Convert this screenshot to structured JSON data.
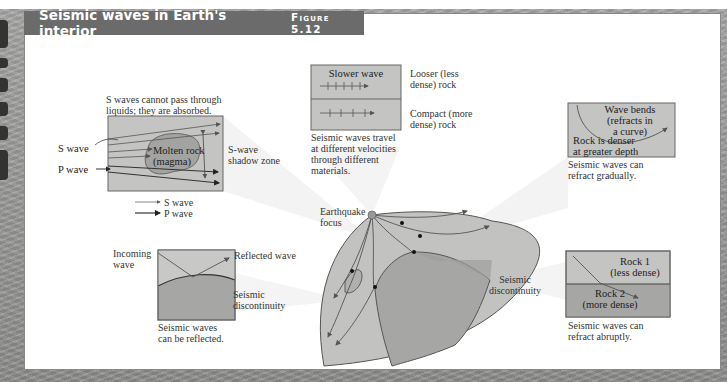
{
  "figure": {
    "title": "Seismic waves in Earth's interior",
    "label": "Figure 5.12"
  },
  "colors": {
    "title_bar": "#6b6b6b",
    "box_light": "#c9c9c7",
    "box_dark": "#a9a9a7",
    "line": "#555555",
    "background_stone": "#9a9a98"
  },
  "absorption_panel": {
    "caption": [
      "S waves cannot pass through",
      "liquids; they are absorbed."
    ],
    "s_wave_label": "S wave",
    "p_wave_label": "P wave",
    "magma_label": [
      "Molten rock",
      "(magma)"
    ],
    "shadow_zone_label": [
      "S-wave",
      "shadow zone"
    ],
    "legend": [
      {
        "icon": "thin-arrow-icon",
        "label": "S wave"
      },
      {
        "icon": "thick-arrow-icon",
        "label": "P wave"
      }
    ]
  },
  "velocity_panel": {
    "box_label": "Slower wave",
    "top_label": [
      "Looser (less",
      "dense) rock"
    ],
    "bottom_label": [
      "Compact (more",
      "dense) rock"
    ],
    "caption": [
      "Seismic waves travel",
      "at different velocities",
      "through different",
      "materials."
    ]
  },
  "gradual_refraction_panel": {
    "box_label_top": [
      "Wave bends",
      "(refracts in",
      "a curve)"
    ],
    "box_label_bottom": [
      "Rock is denser",
      "at greater depth"
    ],
    "caption": [
      "Seismic waves can",
      "refract gradually."
    ]
  },
  "reflection_panel": {
    "incoming_label": [
      "Incoming",
      "wave"
    ],
    "reflected_label": "Reflected wave",
    "discontinuity_label": [
      "Seismic",
      "discontinuity"
    ],
    "caption": [
      "Seismic waves",
      "can be reflected."
    ]
  },
  "earth_section": {
    "focus_label": [
      "Earthquake",
      "focus"
    ],
    "discontinuity_label": [
      "Seismic",
      "discontinuity"
    ]
  },
  "abrupt_refraction_panel": {
    "rock1_label": [
      "Rock 1",
      "(less dense)"
    ],
    "rock2_label": [
      "Rock 2",
      "(more dense)"
    ],
    "caption": [
      "Seismic waves can",
      "refract abruptly."
    ]
  }
}
